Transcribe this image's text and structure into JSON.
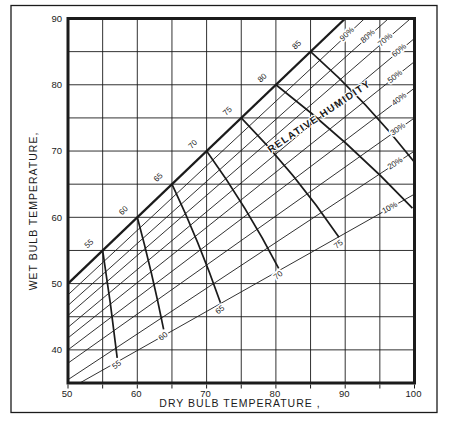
{
  "page": {
    "background": "#ffffff",
    "ink_color": "#1b1b1b"
  },
  "chart_data": {
    "type": "line",
    "variant": "psychrometric-relative-humidity-chart",
    "xlabel": "DRY BULB TEMPERATURE ,",
    "ylabel": "WET BULB TEMPERATURE,",
    "x_range": [
      50,
      100
    ],
    "y_range": [
      35,
      90
    ],
    "grid": true,
    "grid_step": 5,
    "x_ticks": [
      {
        "value": 50,
        "label": "50"
      },
      {
        "value": 60,
        "label": "60"
      },
      {
        "value": 70,
        "label": "70"
      },
      {
        "value": 80,
        "label": "80"
      },
      {
        "value": 90,
        "label": "90"
      },
      {
        "value": 100,
        "label": "100"
      }
    ],
    "y_ticks": [
      {
        "value": 40,
        "label": "40"
      },
      {
        "value": 50,
        "label": "50"
      },
      {
        "value": 60,
        "label": "60"
      },
      {
        "value": 70,
        "label": "70"
      },
      {
        "value": 80,
        "label": "80"
      },
      {
        "value": 90,
        "label": "90"
      }
    ],
    "region_label": {
      "text": "RELATIVE HUMIDITY",
      "db": 86.5,
      "wb": 74.8,
      "angle": -34
    },
    "saturation_line": {
      "from_db_wb": [
        50,
        50
      ],
      "to_db_wb": [
        90,
        90
      ]
    },
    "rh_lines": [
      {
        "label": "90%",
        "wb_at_db50": 48.3,
        "wb_at_db100": 97.0,
        "label_db": 90.5
      },
      {
        "label": "80%",
        "wb_at_db50": 46.7,
        "wb_at_db100": 93.5,
        "label_db": 93.5
      },
      {
        "label": "70%",
        "wb_at_db50": 45.2,
        "wb_at_db100": 90.5,
        "label_db": 96.0
      },
      {
        "label": "60%",
        "wb_at_db50": 43.4,
        "wb_at_db100": 87.0,
        "label_db": 98.0
      },
      {
        "label": "50%",
        "wb_at_db50": 41.8,
        "wb_at_db100": 83.5,
        "label_db": 97.4
      },
      {
        "label": "40%",
        "wb_at_db50": 40.0,
        "wb_at_db100": 79.5,
        "label_db": 98.0
      },
      {
        "label": "30%",
        "wb_at_db50": 38.0,
        "wb_at_db100": 75.0,
        "label_db": 97.8
      },
      {
        "label": "20%",
        "wb_at_db50": 35.5,
        "wb_at_db100": 70.0,
        "label_db": 97.4
      },
      {
        "label": "10%",
        "wb_at_db50": 34.0,
        "wb_at_db100": 63.5,
        "label_db": 96.6
      }
    ],
    "wet_bulb_curves": [
      {
        "label": "55",
        "start_wb": 55,
        "end_db_wb": [
          57.1,
          38.8
        ],
        "end_label": true
      },
      {
        "label": "60",
        "start_wb": 60,
        "end_db_wb": [
          63.8,
          43.1
        ],
        "end_label": true
      },
      {
        "label": "65",
        "start_wb": 65,
        "end_db_wb": [
          72.0,
          47.1
        ],
        "end_label": true
      },
      {
        "label": "70",
        "start_wb": 70,
        "end_db_wb": [
          80.4,
          52.3
        ],
        "end_label": true
      },
      {
        "label": "75",
        "start_wb": 75,
        "end_db_wb": [
          89.1,
          57.0
        ],
        "end_label": true
      },
      {
        "label": "80",
        "start_wb": 80,
        "end_db_wb": [
          99.7,
          61.4
        ],
        "end_label": false
      },
      {
        "label": "85",
        "start_wb": 85,
        "end_db_wb": [
          100.0,
          68.3
        ],
        "end_label": false
      }
    ]
  }
}
